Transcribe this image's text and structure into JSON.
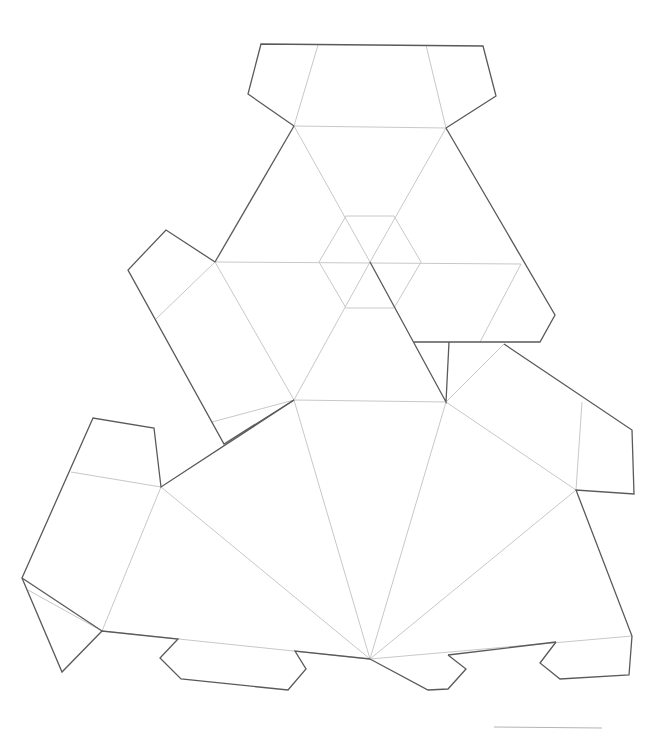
{
  "diagram": {
    "type": "papercraft-net",
    "background": "#ffffff",
    "colors": {
      "cut_line": "#5a5a5a",
      "fold_line": "#c8c8c8",
      "scale_bar": "#b4b4b4"
    },
    "cut_paths": [
      {
        "name": "top-tab",
        "points": "294,126 248,94 261,44 483,46 496,96 446,128"
      },
      {
        "name": "top-triangle-left-edge",
        "points": "294,126 215,262"
      },
      {
        "name": "top-triangle-right-edge",
        "points": "446,128 555,315 540,342 414,342"
      },
      {
        "name": "left-side-tab",
        "points": "215,262 166,230 128,270 224,444 294,400"
      },
      {
        "name": "center-slit",
        "points": "370,262 446,402 449,342"
      },
      {
        "name": "right-upper-tab",
        "points": "504,344 632,430 634,494 576,490 632,636 629,675 560,679 540,663 556,642"
      },
      {
        "name": "bottom-right-tab-edge",
        "points": "556,642 448,655"
      },
      {
        "name": "bottom-center-tab",
        "points": "448,655 466,669 448,689 428,690 370,659"
      },
      {
        "name": "bottom-left-edge",
        "points": "370,659 295,651 306,669 288,690 181,679 160,658 178,639 102,631 62,672 22,578 93,418 154,428 161,487 294,400"
      },
      {
        "name": "left-lower-connector",
        "points": "102,631 22,578"
      }
    ],
    "fold_paths": [
      {
        "name": "top-tab-fold",
        "points": "294,126 446,128"
      },
      {
        "name": "top-tab-left-crease",
        "points": "294,126 318,45"
      },
      {
        "name": "top-tab-right-crease",
        "points": "446,128 426,45"
      },
      {
        "name": "hexagon",
        "points": "346,216 394,216 421,262 394,308 346,308 319,262 346,216"
      },
      {
        "name": "horizontal-midline",
        "points": "215,262 521,264"
      },
      {
        "name": "diag-1",
        "points": "294,126 370,262"
      },
      {
        "name": "diag-2",
        "points": "446,128 370,262"
      },
      {
        "name": "diag-3",
        "points": "370,262 294,400"
      },
      {
        "name": "diag-4",
        "points": "521,264 480,342"
      },
      {
        "name": "left-tab-fold-upper",
        "points": "215,262 156,319"
      },
      {
        "name": "left-tab-fold-main",
        "points": "215,262 294,400"
      },
      {
        "name": "left-tab-fold-lower",
        "points": "294,400 212,422"
      },
      {
        "name": "base-top-edge",
        "points": "294,400 446,402"
      },
      {
        "name": "base-right-diag",
        "points": "446,402 504,344"
      },
      {
        "name": "right-side-1",
        "points": "446,402 576,490"
      },
      {
        "name": "right-tab-fold",
        "points": "576,490 582,402"
      },
      {
        "name": "fan-1",
        "points": "370,659 294,400"
      },
      {
        "name": "fan-2",
        "points": "370,659 446,402"
      },
      {
        "name": "fan-3",
        "points": "370,659 161,487"
      },
      {
        "name": "fan-4",
        "points": "370,659 576,490"
      },
      {
        "name": "left-big-fold",
        "points": "161,487 102,631"
      },
      {
        "name": "left-tab-crease-upper",
        "points": "161,487 71,472"
      },
      {
        "name": "left-tab-crease-lower",
        "points": "102,631 28,590"
      },
      {
        "name": "bottom-left-fold",
        "points": "102,631 370,659"
      },
      {
        "name": "bottom-right-fold",
        "points": "370,659 632,636"
      }
    ],
    "scale_bar": {
      "x1": 494,
      "y1": 727,
      "x2": 602,
      "y2": 728
    }
  }
}
